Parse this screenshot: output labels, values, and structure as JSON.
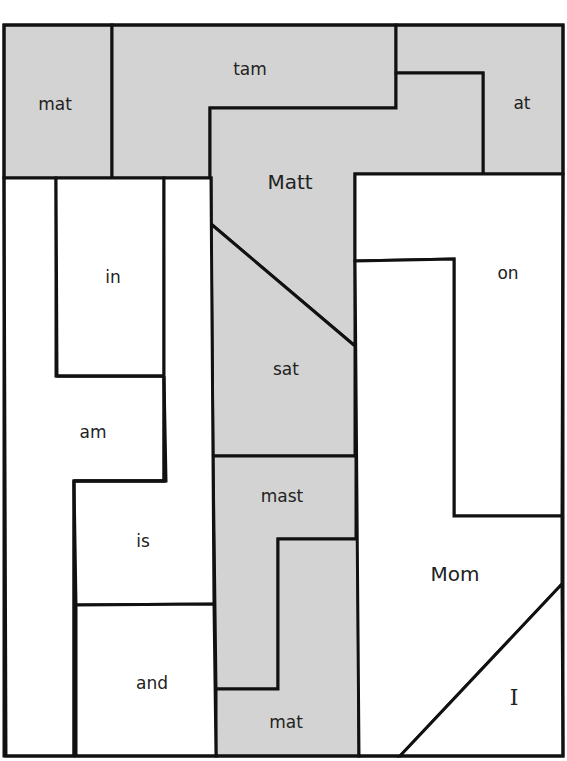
{
  "puzzle": {
    "colors": {
      "shaded": "#d3d3d3",
      "unshaded": "#ffffff",
      "outline": "#111111"
    },
    "pieces": [
      {
        "id": "p1",
        "word": "mat",
        "shaded": true
      },
      {
        "id": "p2",
        "word": "tam",
        "shaded": true
      },
      {
        "id": "p3",
        "word": "at",
        "shaded": true
      },
      {
        "id": "p4",
        "word": "Matt",
        "shaded": true
      },
      {
        "id": "p5",
        "word": "in",
        "shaded": false
      },
      {
        "id": "p6",
        "word": "on",
        "shaded": false
      },
      {
        "id": "p7",
        "word": "sat",
        "shaded": true
      },
      {
        "id": "p8",
        "word": "am",
        "shaded": false
      },
      {
        "id": "p9",
        "word": "mast",
        "shaded": true
      },
      {
        "id": "p10",
        "word": "is",
        "shaded": false
      },
      {
        "id": "p11",
        "word": "Mom",
        "shaded": false
      },
      {
        "id": "p12",
        "word": "and",
        "shaded": false
      },
      {
        "id": "p13",
        "word": "mat",
        "shaded": true
      },
      {
        "id": "p14",
        "word": "I",
        "shaded": false
      }
    ]
  }
}
